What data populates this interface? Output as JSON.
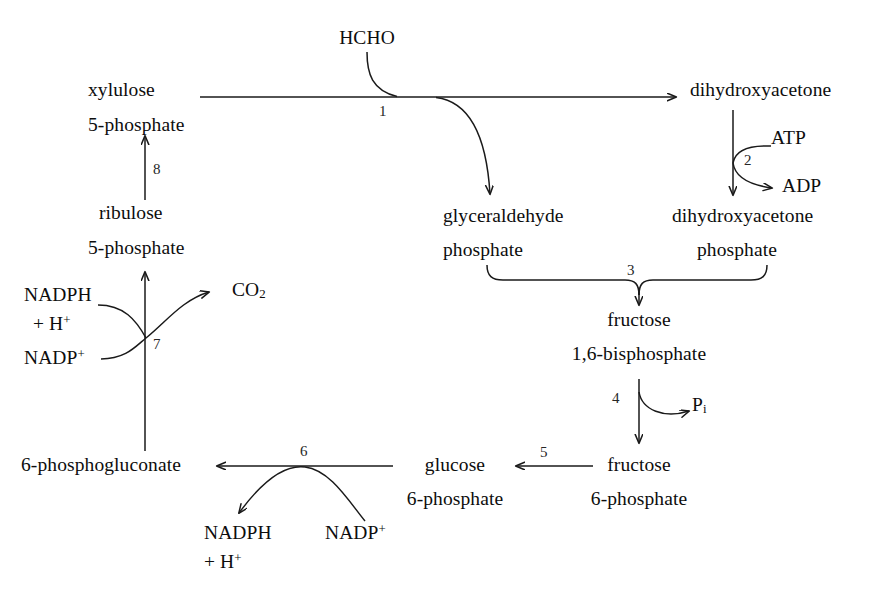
{
  "diagram": {
    "type": "metabolic-pathway-flow-diagram",
    "background_color": "#ffffff",
    "line_color": "#1a1a1a",
    "text_color": "#0d0d0d"
  },
  "metabolites": {
    "hcho": "HCHO",
    "xylulose": "xylulose",
    "xylulose_5p": "5-phosphate",
    "ribulose": "ribulose",
    "ribulose_5p": "5-phosphate",
    "dihydroxyacetone": "dihydroxyacetone",
    "dihydroxyacetone_p_name": "dihydroxyacetone",
    "dihydroxyacetone_p_suffix": "phosphate",
    "glyceraldehyde": "glyceraldehyde",
    "glyceraldehyde_p_suffix": "phosphate",
    "fructose_bis_name": "fructose",
    "fructose_bis_suffix": "1,6-bisphosphate",
    "fructose_6p_name": "fructose",
    "fructose_6p_suffix": "6-phosphate",
    "glucose_6p_name": "glucose",
    "glucose_6p_suffix": "6-phosphate",
    "phosphogluconate": "6-phosphogluconate"
  },
  "cofactors": {
    "atp": "ATP",
    "adp": "ADP",
    "pi_base": "P",
    "pi_sub": "i",
    "co2_base": "CO",
    "co2_sub": "2",
    "nadph_top": "NADPH",
    "nadph_bottom_plus": "+ H",
    "nadph_bottom_sup": "+",
    "nadp_base": "NADP",
    "nadp_sup": "+",
    "nadph_bottom_left_top": "NADPH",
    "nadph_bottom_left_plus": "+ H",
    "nadp_bottom_right_base": "NADP",
    "nadp_bottom_right_sup": "+"
  },
  "steps": [
    {
      "id": "1",
      "label": "1",
      "description": "condensation of HCHO with xylulose 5-phosphate"
    },
    {
      "id": "2",
      "label": "2",
      "description": "dihydroxyacetone kinase (ATP to ADP)"
    },
    {
      "id": "3",
      "label": "3",
      "description": "aldolase joining glyceraldehyde phosphate and dihydroxyacetone phosphate"
    },
    {
      "id": "4",
      "label": "4",
      "description": "fructose bisphosphatase releasing Pi"
    },
    {
      "id": "5",
      "label": "5",
      "description": "phosphoglucose isomerase"
    },
    {
      "id": "6",
      "label": "6",
      "description": "glucose 6-phosphate dehydrogenase, NADP+ to NADPH + H+"
    },
    {
      "id": "7",
      "label": "7",
      "description": "6-phosphogluconate dehydrogenase, NADP+ to NADPH + H+ with CO2 release"
    },
    {
      "id": "8",
      "label": "8",
      "description": "ribulose 5-phosphate epimerase"
    }
  ]
}
